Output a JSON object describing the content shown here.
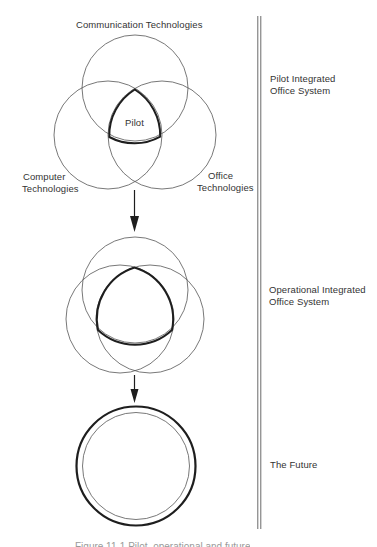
{
  "diagram": {
    "stages": [
      {
        "id": "pilot",
        "title_lines": [
          "Pilot Integrated",
          "Office System"
        ],
        "center_label": "Pilot",
        "circle_labels": {
          "top": "Communication Technologies",
          "left": [
            "Computer",
            "Technologies"
          ],
          "right": [
            "Office",
            "Technologies"
          ]
        }
      },
      {
        "id": "operational",
        "title_lines": [
          "Operational Integrated",
          "Office System"
        ]
      },
      {
        "id": "future",
        "title_lines": [
          "The Future"
        ]
      }
    ],
    "caption": "Figure 11-1 Pilot, operational and future"
  },
  "colors": {
    "line": "#4a4a4a",
    "bold_line": "#1e1e1e",
    "text": "#333333",
    "background": "#ffffff"
  }
}
